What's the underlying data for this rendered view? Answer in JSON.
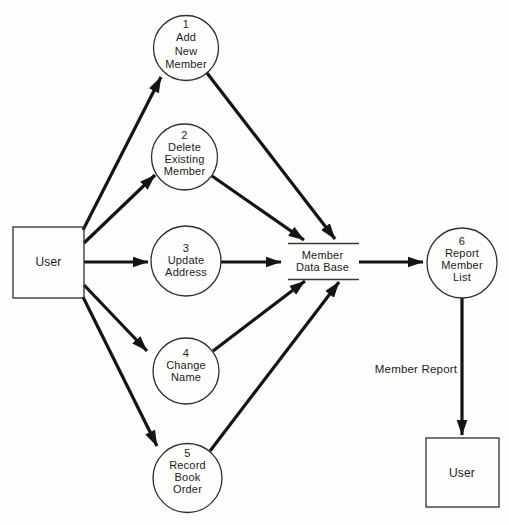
{
  "diagram": {
    "type": "data-flow-diagram",
    "colors": {
      "ink": "#141414",
      "outline": "#2f2f2f",
      "background": "#fdfdfb"
    },
    "external_entities": [
      {
        "id": "user-source",
        "label": "User"
      },
      {
        "id": "user-sink",
        "label": "User"
      }
    ],
    "processes": [
      {
        "number": "1",
        "name_lines": [
          "Add",
          "New",
          "Member"
        ]
      },
      {
        "number": "2",
        "name_lines": [
          "Delete",
          "Existing",
          "Member"
        ]
      },
      {
        "number": "3",
        "name_lines": [
          "Update",
          "Address"
        ]
      },
      {
        "number": "4",
        "name_lines": [
          "Change",
          "Name"
        ]
      },
      {
        "number": "5",
        "name_lines": [
          "Record",
          "Book",
          "Order"
        ]
      },
      {
        "number": "6",
        "name_lines": [
          "Report",
          "Member",
          "List"
        ]
      }
    ],
    "data_stores": [
      {
        "name_lines": [
          "Member",
          "Data Base"
        ]
      }
    ],
    "flows": [
      {
        "from": "User",
        "to": "1 Add New Member",
        "label": ""
      },
      {
        "from": "User",
        "to": "2 Delete Existing Member",
        "label": ""
      },
      {
        "from": "User",
        "to": "3 Update Address",
        "label": ""
      },
      {
        "from": "User",
        "to": "4 Change Name",
        "label": ""
      },
      {
        "from": "User",
        "to": "5 Record Book Order",
        "label": ""
      },
      {
        "from": "1 Add New Member",
        "to": "Member Data Base",
        "label": ""
      },
      {
        "from": "2 Delete Existing Member",
        "to": "Member Data Base",
        "label": ""
      },
      {
        "from": "3 Update Address",
        "to": "Member Data Base",
        "label": ""
      },
      {
        "from": "4 Change Name",
        "to": "Member Data Base",
        "label": ""
      },
      {
        "from": "5 Record Book Order",
        "to": "Member Data Base",
        "label": ""
      },
      {
        "from": "Member Data Base",
        "to": "6 Report Member List",
        "label": ""
      },
      {
        "from": "6 Report Member List",
        "to": "User",
        "label": "Member Report"
      }
    ]
  }
}
